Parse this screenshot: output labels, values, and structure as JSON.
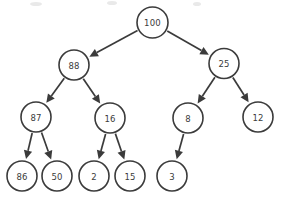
{
  "diagram": {
    "type": "binary-tree",
    "background_color": "#ffffff",
    "stroke_color": "#3b3b3b",
    "node_fill_color": "#ffffff",
    "text_color": "#3b3b3b",
    "node_radius": 15,
    "nodes": [
      {
        "id": "n100",
        "label": "100",
        "cx": 152.5,
        "cy": 22.5,
        "r": 15.5,
        "level": 0
      },
      {
        "id": "n88",
        "label": "88",
        "cx": 74.0,
        "cy": 65.0,
        "r": 15.0,
        "level": 1
      },
      {
        "id": "n25",
        "label": "25",
        "cx": 224.0,
        "cy": 63.5,
        "r": 15.0,
        "level": 1
      },
      {
        "id": "n87",
        "label": "87",
        "cx": 36.0,
        "cy": 117.0,
        "r": 15.0,
        "level": 2
      },
      {
        "id": "n16",
        "label": "16",
        "cx": 110.0,
        "cy": 118.0,
        "r": 15.0,
        "level": 2
      },
      {
        "id": "n8",
        "label": "8",
        "cx": 188.0,
        "cy": 118.0,
        "r": 15.0,
        "level": 2
      },
      {
        "id": "n12",
        "label": "12",
        "cx": 258.0,
        "cy": 117.0,
        "r": 15.0,
        "level": 2
      },
      {
        "id": "n86",
        "label": "86",
        "cx": 22.0,
        "cy": 176.0,
        "r": 15.0,
        "level": 3
      },
      {
        "id": "n50",
        "label": "50",
        "cx": 57.0,
        "cy": 176.0,
        "r": 15.0,
        "level": 3
      },
      {
        "id": "n2",
        "label": "2",
        "cx": 94.0,
        "cy": 176.0,
        "r": 15.0,
        "level": 3
      },
      {
        "id": "n15",
        "label": "15",
        "cx": 130.0,
        "cy": 176.0,
        "r": 15.0,
        "level": 3
      },
      {
        "id": "n3",
        "label": "3",
        "cx": 172.0,
        "cy": 176.0,
        "r": 15.0,
        "level": 3
      }
    ],
    "edges": [
      {
        "id": "e100-88",
        "from": "n100",
        "to": "n88",
        "from_label": "100",
        "to_label": "88",
        "directed": true
      },
      {
        "id": "e100-25",
        "from": "n100",
        "to": "n25",
        "from_label": "100",
        "to_label": "25",
        "directed": true
      },
      {
        "id": "e88-87",
        "from": "n88",
        "to": "n87",
        "from_label": "88",
        "to_label": "87",
        "directed": true
      },
      {
        "id": "e88-16",
        "from": "n88",
        "to": "n16",
        "from_label": "88",
        "to_label": "16",
        "directed": true
      },
      {
        "id": "e25-8",
        "from": "n25",
        "to": "n8",
        "from_label": "25",
        "to_label": "8",
        "directed": true
      },
      {
        "id": "e25-12",
        "from": "n25",
        "to": "n12",
        "from_label": "25",
        "to_label": "12",
        "directed": true
      },
      {
        "id": "e87-86",
        "from": "n87",
        "to": "n86",
        "from_label": "87",
        "to_label": "86",
        "directed": true
      },
      {
        "id": "e87-50",
        "from": "n87",
        "to": "n50",
        "from_label": "87",
        "to_label": "50",
        "directed": true
      },
      {
        "id": "e16-2",
        "from": "n16",
        "to": "n2",
        "from_label": "16",
        "to_label": "2",
        "directed": true
      },
      {
        "id": "e16-15",
        "from": "n16",
        "to": "n15",
        "from_label": "16",
        "to_label": "15",
        "directed": true
      },
      {
        "id": "e8-3",
        "from": "n8",
        "to": "n3",
        "from_label": "8",
        "to_label": "3",
        "directed": true
      }
    ],
    "specks": [
      {
        "cx": 36,
        "cy": 4,
        "rx": 6,
        "ry": 2
      },
      {
        "cx": 112,
        "cy": 3,
        "rx": 5,
        "ry": 2
      },
      {
        "cx": 197,
        "cy": 4,
        "rx": 4,
        "ry": 2
      }
    ]
  }
}
